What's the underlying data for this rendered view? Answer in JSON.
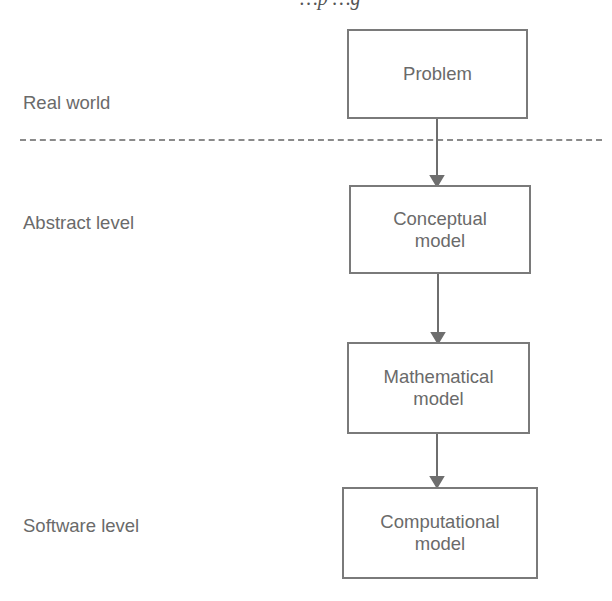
{
  "caption_fragment": "…p                                  …g",
  "levels": [
    {
      "label": "Real world",
      "top": 92
    },
    {
      "label": "Abstract level",
      "top": 212
    },
    {
      "label": "Software level",
      "top": 515
    }
  ],
  "boxes": [
    {
      "id": "problem",
      "line1": "Problem",
      "line2": ""
    },
    {
      "id": "conceptual",
      "line1": "Conceptual",
      "line2": "model"
    },
    {
      "id": "mathematical",
      "line1": "Mathematical",
      "line2": "model"
    },
    {
      "id": "computational",
      "line1": "Computational",
      "line2": "model"
    }
  ],
  "colors": {
    "stroke": "#7a7a7a",
    "text": "#6a6a6a",
    "dash": "#8a8a8a"
  }
}
